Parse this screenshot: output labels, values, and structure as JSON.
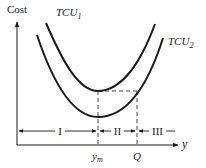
{
  "diagram": {
    "y_axis_label": "Cost",
    "x_axis_label": "y",
    "curves": [
      {
        "name": "TCU",
        "subscript": "1",
        "description": "upper total cost curve"
      },
      {
        "name": "TCU",
        "subscript": "2",
        "description": "lower total cost curve"
      }
    ],
    "markers": [
      {
        "label_main": "y",
        "label_sub": "m"
      },
      {
        "label_main": "Q",
        "label_sub": ""
      }
    ],
    "regions": [
      {
        "label": "I"
      },
      {
        "label": "II"
      },
      {
        "label": "III"
      }
    ],
    "colors": {
      "stroke": "#1a1a1a",
      "background": "#ffffff"
    }
  }
}
